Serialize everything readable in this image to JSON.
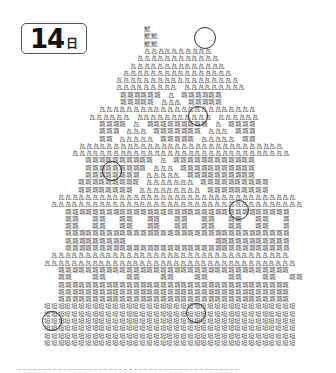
{
  "day_badge": {
    "number": "14",
    "unit": "日"
  },
  "puzzle": {
    "type": "find-the-different-kanji",
    "chars": {
      "S": "鯱",
      "K": "瓦",
      "J": "城",
      "G": "垣"
    },
    "cell_width": 6.8,
    "row_height": 7.3,
    "rows": [
      {
        "x": 144,
        "p": "S"
      },
      {
        "x": 144,
        "p": "SS"
      },
      {
        "x": 144,
        "p": "SS"
      },
      {
        "x": 144,
        "p": "KKKKKKKKKK"
      },
      {
        "x": 137,
        "p": "KKKKKKKKKKKK"
      },
      {
        "x": 130,
        "p": "KKKKKKKKKKKKKK"
      },
      {
        "x": 123,
        "p": "KKKKKKKKKKKKKKKK"
      },
      {
        "x": 116,
        "p": "KKKKKKKKKKKKKKKKKK"
      },
      {
        "x": 116,
        "p": "KKKKKKKKK KKKKKKKKK"
      },
      {
        "x": 120,
        "p": "JJJJJJ K JJJJJJ"
      },
      {
        "x": 120,
        "p": "JJJJJ KKK JJJJJ"
      },
      {
        "x": 99,
        "p": "KKKKKKKKKKKKKKKKKKKKKKK"
      },
      {
        "x": 89,
        "p": "KKKKKK KKKKKKKKKKK KKKKKK"
      },
      {
        "x": 99,
        "p": "JJJJ K JJJJJJJJJ K JJJJ"
      },
      {
        "x": 99,
        "p": "JJJ KKK JJJJJJJ KKK JJJ"
      },
      {
        "x": 99,
        "p": "JJ KKKKK JJJJJ KKKKK JJ"
      },
      {
        "x": 79,
        "p": "KKKKKKKKKKKKKKKKKKKKKKKKKKKKKK"
      },
      {
        "x": 72,
        "p": "KKKKKKKKKKKKKKKKKKKKKKKKKKKKKKKK"
      },
      {
        "x": 85,
        "p": "JJJJJJJJJJ K JJJJJJJJJJJJ"
      },
      {
        "x": 85,
        "p": "JJJJJJJJJ KKK JJJJJJJJJJJ"
      },
      {
        "x": 85,
        "p": "JJJJJJJJ KKKKK JJJJJJJJJJ"
      },
      {
        "x": 78,
        "p": "JJJJJJJJJ KKKKKKK JJJJJJJJJJ"
      },
      {
        "x": 78,
        "p": "JJJJJJJJ KKKKKKKKK JJJJJJJJJ"
      },
      {
        "x": 58,
        "p": "KKKKKKKKKKKKKKKKKKKKKKKKKKKKKKKKKKK"
      },
      {
        "x": 51,
        "p": "KKKKKKKKKKKKKKKKKKKKKKKKKKKKKKKKKKKKK"
      },
      {
        "x": 65,
        "p": "JJJJJJJJJJJJJJJJJJJJJJJJJJJJJJJJJ"
      },
      {
        "x": 65,
        "p": "JJ  JJ  JJ  JJ  JJ  JJ  JJ  JJ  J"
      },
      {
        "x": 65,
        "p": "JJ  JJ  JJ  JJ  JJ  JJ  JJ  JJ  J"
      },
      {
        "x": 65,
        "p": "JJJJJJJJJJJJJJJJJJJJJJJJJJJJJJJJJ"
      },
      {
        "x": 65,
        "p": "JJJJJJJJJ             JJJJJJJJJJJ"
      },
      {
        "x": 65,
        "p": "JJJJJJJJJJJJJJJJJJJJJJJJJJJJJJJJJ"
      },
      {
        "x": 51,
        "p": "KKKKKKKKKKKKKKKKKKKKKKKKKKKKKKKKKKK"
      },
      {
        "x": 44,
        "p": "KKKKKKKKKKKKKKKKKKKKKKKKKKKKKKKKKKKKK"
      },
      {
        "x": 58,
        "p": "JJJJJJJJJJJJJJJJJJJJJJJJJJJJJJJJJJ"
      },
      {
        "x": 58,
        "p": "JJ   JJ   JJ   JJ   JJ   JJ   JJ  JJ"
      },
      {
        "x": 58,
        "p": "JJJJJJJJJJJJJJJJJJJJJJJJJJJJJJJJJJ"
      },
      {
        "x": 58,
        "p": "JJJJJJJJJJJJJJJJJJJJJJJJJJJJJJJJJJ"
      },
      {
        "x": 58,
        "p": "JJJJJJJJJJJJJJJJJJJJJJJJJJJJJJJJJJ"
      },
      {
        "x": 44,
        "p": "GGGGGGGGGGGGGGGGGGGGGGGGGGGGGGGGGGGGG"
      },
      {
        "x": 44,
        "p": "GGGGGGGGGGGGGGGGGGGGGGGGGGGGGGGGGGGGG"
      },
      {
        "x": 44,
        "p": "GGGGGGGGGGGGGGGGGGGGGGGGGGGGGGGGGGGGG"
      },
      {
        "x": 44,
        "p": "GGGGGGGGGGGGGGGGGGGGGGGGGGGGGGGGGGGGG"
      },
      {
        "x": 44,
        "p": "GGGGGGGGGGGGGGGGGGGGGGGGGGGGGGGGGGGGG"
      },
      {
        "x": 44,
        "p": "GGGGGGGGGGGGGGGGGGGGGGGGGGGGGGGGGGGGG"
      }
    ],
    "answer_circles": [
      {
        "cx": 205,
        "cy": 38,
        "r": 11
      },
      {
        "cx": 198,
        "cy": 116,
        "r": 10
      },
      {
        "cx": 112,
        "cy": 171,
        "r": 10
      },
      {
        "cx": 239,
        "cy": 210,
        "r": 10
      },
      {
        "cx": 52,
        "cy": 321,
        "r": 10
      },
      {
        "cx": 196,
        "cy": 313,
        "r": 10
      }
    ]
  },
  "footer": {
    "divider": "dashed"
  }
}
